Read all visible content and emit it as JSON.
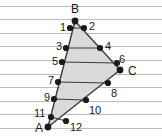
{
  "figure": {
    "background_color": "#ffffff",
    "rule_line_color": "#b9bcc0",
    "triangle_fill_color": "#d8d8d8",
    "triangle_stroke_color": "#3b3b3b",
    "point_color": "#1a1a1a",
    "width": 162,
    "height": 137
  },
  "rule_lines": {
    "count": 9,
    "start_y": 6,
    "spacing": 13.6,
    "y_values": [
      6,
      19.6,
      33.2,
      46.8,
      60.4,
      74,
      87.6,
      101.2,
      114.8,
      128.4
    ]
  },
  "vertices": [
    {
      "label": "A",
      "x": 48,
      "y": 127,
      "label_x": 35,
      "label_y": 123
    },
    {
      "label": "B",
      "x": 75,
      "y": 21,
      "label_x": 71,
      "label_y": 4
    },
    {
      "label": "C",
      "x": 120,
      "y": 70,
      "label_x": 128,
      "label_y": 66
    }
  ],
  "points": [
    {
      "label": "1",
      "x": 70,
      "y": 28,
      "label_x": 60,
      "label_y": 22
    },
    {
      "label": "2",
      "x": 84,
      "y": 28,
      "label_x": 89,
      "label_y": 21
    },
    {
      "label": "3",
      "x": 66,
      "y": 48,
      "label_x": 56,
      "label_y": 41
    },
    {
      "label": "4",
      "x": 100,
      "y": 48,
      "label_x": 105,
      "label_y": 41
    },
    {
      "label": "5",
      "x": 62,
      "y": 62,
      "label_x": 52,
      "label_y": 56
    },
    {
      "label": "6",
      "x": 117,
      "y": 63,
      "label_x": 119,
      "label_y": 54
    },
    {
      "label": "7",
      "x": 58,
      "y": 82,
      "label_x": 48,
      "label_y": 75
    },
    {
      "label": "8",
      "x": 108,
      "y": 83,
      "label_x": 111,
      "label_y": 88
    },
    {
      "label": "9",
      "x": 54,
      "y": 99,
      "label_x": 44,
      "label_y": 92
    },
    {
      "label": "10",
      "x": 86,
      "y": 100,
      "label_x": 89,
      "label_y": 105
    },
    {
      "label": "11",
      "x": 51,
      "y": 117,
      "label_x": 34,
      "label_y": 108
    },
    {
      "label": "12",
      "x": 66,
      "y": 121,
      "label_x": 70,
      "label_y": 122
    }
  ],
  "triangle_path": "M 75,21 L 120,70 L 48,127 Z",
  "chords": [
    "M 70,28 L 84,28",
    "M 66,48 L 100,48",
    "M 62,62 L 117,63",
    "M 58,82 L 108,83",
    "M 54,99 L 86,100",
    "M 51,117 L 66,121"
  ]
}
